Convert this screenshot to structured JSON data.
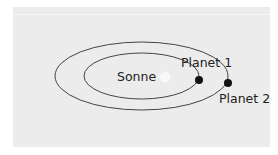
{
  "diagram": {
    "type": "orbit-diagram",
    "colors": {
      "background": "#ececec",
      "orbit_stroke": "#444444",
      "planet_fill": "#111111",
      "sun_fill": "#f8f8f8",
      "text": "#222222"
    },
    "sun": {
      "label": "Sonne"
    },
    "orbits": [
      {
        "name": "inner-orbit"
      },
      {
        "name": "outer-orbit"
      }
    ],
    "planets": [
      {
        "label": "Planet 1"
      },
      {
        "label": "Planet 2"
      }
    ]
  }
}
